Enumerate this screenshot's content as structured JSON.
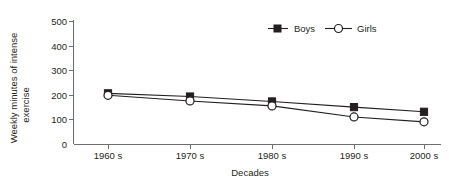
{
  "chart_data": {
    "type": "line",
    "title": "",
    "subtitle": "",
    "xlabel": "Decades",
    "ylabel_line1": "Weekly minutes of intense",
    "ylabel_line2": "exercise",
    "ylabel": "Weekly minutes of intense exercise",
    "categories": [
      "1960 s",
      "1970 s",
      "1980 s",
      "1990 s",
      "2000 s"
    ],
    "yticks": [
      "0",
      "100",
      "200",
      "300",
      "400",
      "500"
    ],
    "ytick_values": [
      0,
      100,
      200,
      300,
      400,
      500
    ],
    "ylim": [
      0,
      500
    ],
    "grid": false,
    "legend_position": "top-right",
    "series": [
      {
        "name": "Boys",
        "marker": "filled-square",
        "color": "#231f20",
        "values": [
          208,
          195,
          175,
          152,
          133
        ]
      },
      {
        "name": "Girls",
        "marker": "open-circle",
        "color": "#231f20",
        "values": [
          200,
          177,
          157,
          112,
          92
        ]
      }
    ]
  },
  "legend": {
    "items": [
      {
        "label": "Boys",
        "marker": "filled-square"
      },
      {
        "label": "Girls",
        "marker": "open-circle"
      }
    ]
  },
  "colors": {
    "ink": "#231f20",
    "axis": "#6d6e71",
    "background": "#ffffff"
  }
}
